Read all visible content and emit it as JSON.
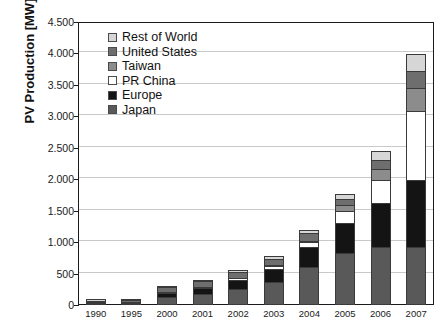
{
  "chart_data": {
    "type": "bar",
    "subtype": "stacked-bar",
    "title": "",
    "xlabel": "",
    "ylabel": "PV Production [MW]",
    "ylim": [
      0,
      4500
    ],
    "ytick_step": 500,
    "grid": true,
    "legend_position": "top-left inside plot",
    "number_format": "european-thousands-dot",
    "categories": [
      "1990",
      "1995",
      "2000",
      "2001",
      "2002",
      "2003",
      "2004",
      "2005",
      "2006",
      "2007"
    ],
    "ytick_labels": [
      "0",
      "500",
      "1.000",
      "1.500",
      "2.000",
      "2.500",
      "3.000",
      "3.500",
      "4.000",
      "4.500"
    ],
    "ytick_values": [
      0,
      500,
      1000,
      1500,
      2000,
      2500,
      3000,
      3500,
      4000,
      4500
    ],
    "stack_order_bottom_to_top": [
      "Japan",
      "Europe",
      "PR China",
      "Taiwan",
      "United States",
      "Rest of World"
    ],
    "series": [
      {
        "name": "Japan",
        "color": "#595959",
        "values": [
          18,
          26,
          130,
          180,
          260,
          370,
          600,
          830,
          930,
          920
        ]
      },
      {
        "name": "Europe",
        "color": "#141414",
        "values": [
          8,
          18,
          60,
          90,
          140,
          200,
          320,
          470,
          690,
          1070
        ]
      },
      {
        "name": "PR China",
        "color": "#ffffff",
        "values": [
          0,
          0,
          8,
          15,
          30,
          50,
          75,
          200,
          370,
          1090
        ]
      },
      {
        "name": "Taiwan",
        "color": "#8c8c8c",
        "values": [
          0,
          0,
          0,
          0,
          0,
          10,
          25,
          90,
          170,
          370
        ]
      },
      {
        "name": "United States",
        "color": "#6e6e6e",
        "values": [
          16,
          26,
          70,
          90,
          100,
          100,
          120,
          100,
          140,
          270
        ]
      },
      {
        "name": "Rest of World",
        "color": "#d6d6d6",
        "values": [
          4,
          8,
          22,
          25,
          30,
          40,
          60,
          70,
          150,
          280
        ]
      }
    ],
    "totals": [
      46,
      78,
      290,
      400,
      560,
      770,
      1200,
      1760,
      2450,
      4000
    ]
  },
  "legend": {
    "items": [
      {
        "label": "Rest of World",
        "color": "#d6d6d6"
      },
      {
        "label": "United States",
        "color": "#6e6e6e"
      },
      {
        "label": "Taiwan",
        "color": "#8c8c8c"
      },
      {
        "label": "PR China",
        "color": "#ffffff"
      },
      {
        "label": "Europe",
        "color": "#141414"
      },
      {
        "label": "Japan",
        "color": "#595959"
      }
    ]
  },
  "axes": {
    "y_title": "PV Production [MW]"
  }
}
